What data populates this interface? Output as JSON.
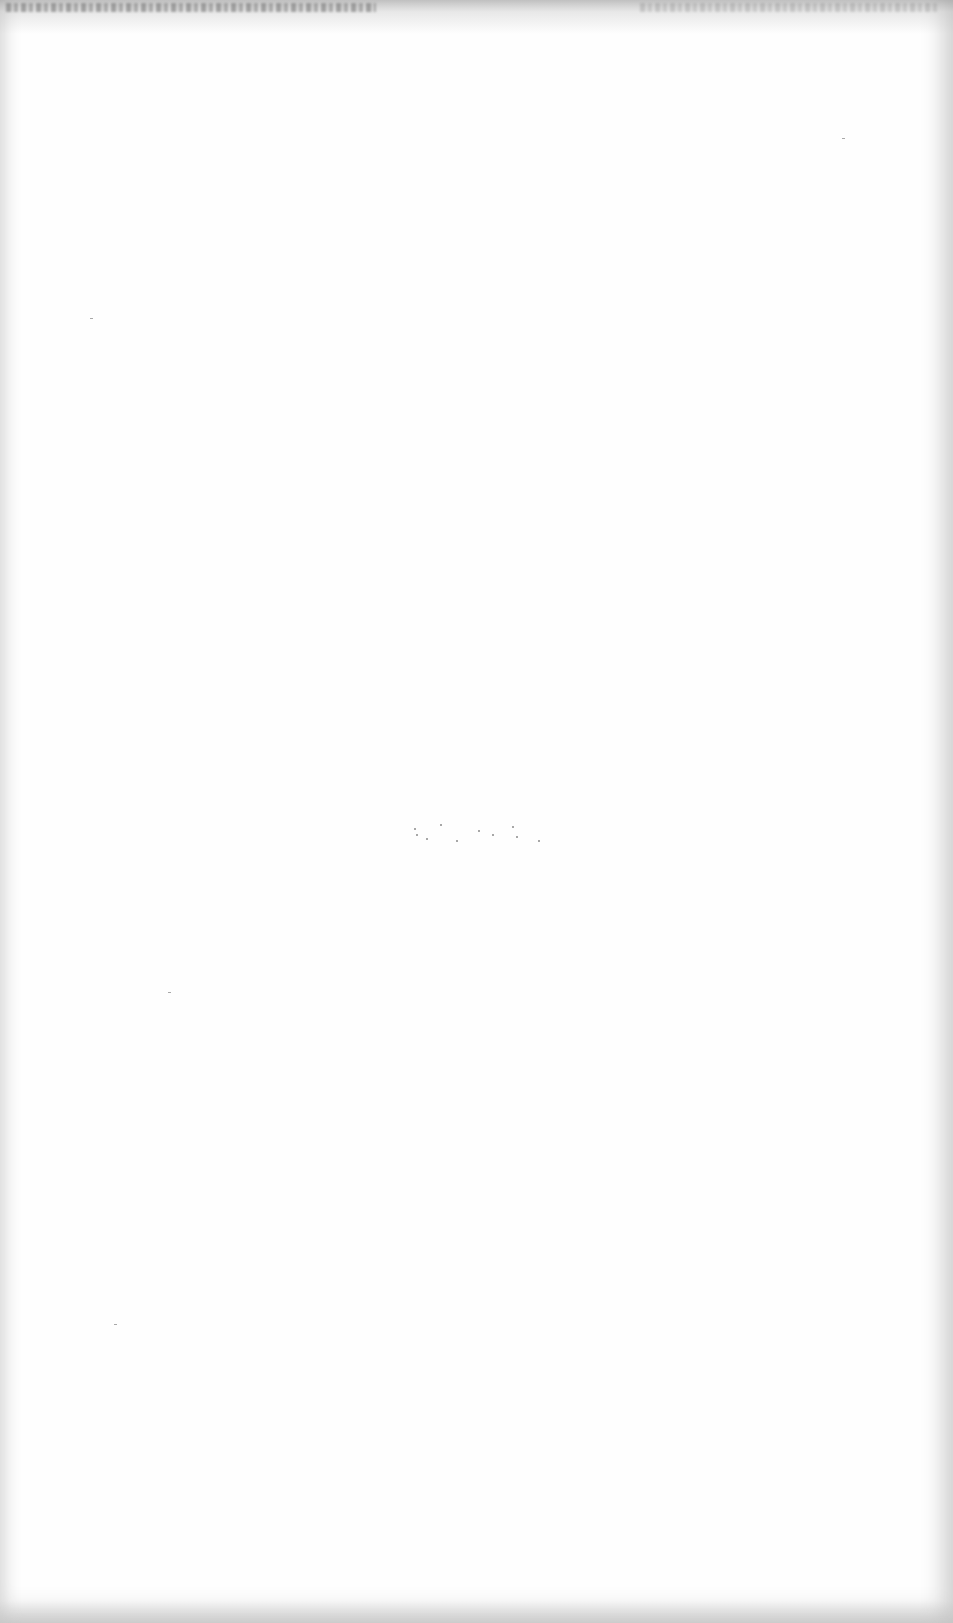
{
  "document": {
    "type": "blank scanned page",
    "text_content": "",
    "background_color": "#fefefe",
    "margin_shadow_color": "#d0d0d0"
  }
}
